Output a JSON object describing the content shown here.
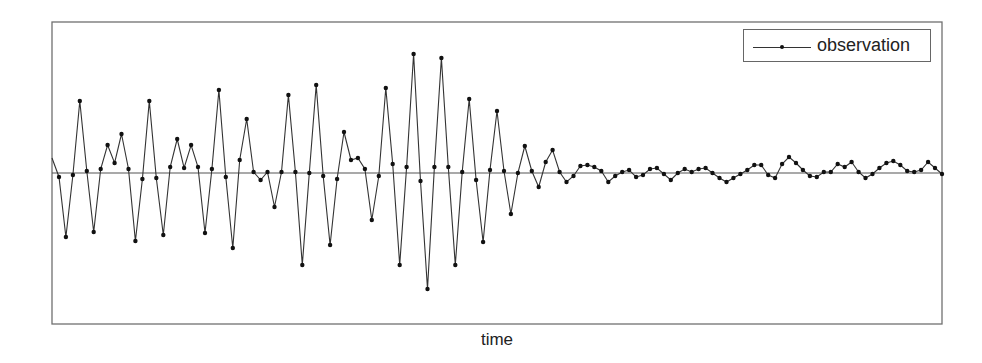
{
  "chart_data": {
    "type": "line",
    "title": "",
    "xlabel": "time",
    "ylabel": "",
    "grid": false,
    "legend": {
      "position": "upper right",
      "entries": [
        "observation"
      ]
    },
    "axis_ticks": "none",
    "baseline": 0,
    "series": [
      {
        "name": "observation",
        "marker": "dot",
        "note": "values in relative units (positive = up), baseline at 0; first point drawn without marker",
        "values": [
          15,
          -4,
          -64,
          -2,
          72,
          2,
          -59,
          4,
          28,
          10,
          39,
          4,
          -68,
          -6,
          72,
          -5,
          -62,
          6,
          34,
          5,
          28,
          6,
          -60,
          4,
          83,
          -4,
          -75,
          13,
          54,
          1,
          -7,
          1,
          -34,
          1,
          78,
          1,
          -92,
          0,
          88,
          -3,
          -72,
          -6,
          41,
          13,
          15,
          4,
          -47,
          -3,
          85,
          9,
          -92,
          6,
          119,
          -8,
          -116,
          6,
          115,
          6,
          -92,
          1,
          74,
          -7,
          -69,
          3,
          62,
          2,
          -41,
          0,
          27,
          2,
          -14,
          11,
          23,
          1,
          -9,
          -3,
          7,
          8,
          6,
          2,
          -9,
          -3,
          1,
          3,
          -4,
          -2,
          4,
          5,
          -1,
          -7,
          0,
          4,
          1,
          4,
          5,
          0,
          -5,
          -9,
          -5,
          -1,
          3,
          8,
          8,
          -2,
          -5,
          9,
          16,
          10,
          3,
          -3,
          -4,
          1,
          1,
          9,
          6,
          11,
          1,
          -5,
          -1,
          5,
          10,
          12,
          8,
          2,
          1,
          3,
          11,
          5,
          -1
        ]
      }
    ]
  },
  "legend": {
    "label": "observation"
  },
  "axes": {
    "xlabel": "time"
  }
}
